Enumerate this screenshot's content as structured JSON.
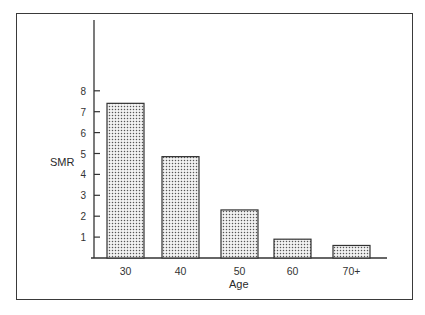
{
  "chart_data": {
    "type": "bar",
    "title": "",
    "xlabel": "Age",
    "ylabel": "SMR",
    "categories": [
      "30",
      "40",
      "50",
      "60",
      "70+"
    ],
    "values": [
      7.4,
      4.85,
      2.3,
      0.9,
      0.6
    ],
    "ylim": [
      0,
      9
    ],
    "yticks": [
      1,
      2,
      3,
      4,
      5,
      6,
      7,
      8
    ],
    "grid": false,
    "legend": null,
    "bar_fill": "stippled grey dots",
    "frame": true
  }
}
